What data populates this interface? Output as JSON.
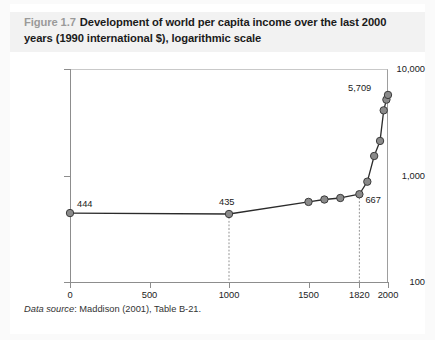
{
  "figure": {
    "number": "Figure 1.7",
    "caption": "Development of world per capita income over the last 2000 years (1990 international $), logarithmic scale"
  },
  "source_note": {
    "label": "Data source",
    "text": ": Maddison (2001), Table B-21."
  },
  "colors": {
    "marker_fill": "#8a8a8a",
    "marker_stroke": "#3b3b3b",
    "line": "#2b2b2b",
    "axis": "#8d8d8d",
    "guide": "#999999",
    "title_band": "#f2f2f2",
    "figure_number": "#9a9a9a"
  },
  "chart_data": {
    "type": "line",
    "title": "Development of world per capita income over the last 2000 years (1990 international $), logarithmic scale",
    "xlabel": "",
    "ylabel": "",
    "yscale": "log",
    "ylim": [
      100,
      10000
    ],
    "xlim": [
      0,
      2000
    ],
    "grid": false,
    "legend": false,
    "ytick_labels": [
      "100",
      "1,000",
      "10,000"
    ],
    "ytick_values": [
      100,
      1000,
      10000
    ],
    "xtick_labels": [
      "0",
      "500",
      "1000",
      "1500",
      "1820",
      "2000"
    ],
    "xtick_values": [
      0,
      500,
      1000,
      1500,
      1820,
      2000
    ],
    "x": [
      0,
      1000,
      1500,
      1600,
      1700,
      1820,
      1870,
      1913,
      1950,
      1973,
      1990,
      2000
    ],
    "values": [
      444,
      435,
      565,
      595,
      615,
      667,
      875,
      1525,
      2111,
      4091,
      5157,
      5709
    ],
    "annotations": [
      {
        "label": "444",
        "x": 0,
        "y": 444
      },
      {
        "label": "435",
        "x": 1000,
        "y": 435
      },
      {
        "label": "667",
        "x": 1820,
        "y": 667
      },
      {
        "label": "5,709",
        "x": 2000,
        "y": 5709
      }
    ],
    "guide_lines": [
      {
        "x": 1000,
        "from_y": 435,
        "to_y": 100,
        "style": "dotted"
      },
      {
        "x": 1820,
        "from_y": 667,
        "to_y": 100,
        "style": "dotted"
      }
    ]
  }
}
